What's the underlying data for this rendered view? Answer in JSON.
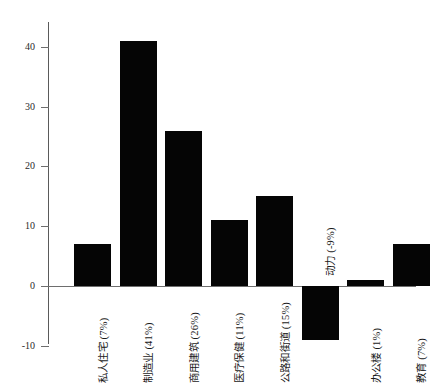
{
  "chart_data": {
    "type": "bar",
    "title": "",
    "subtitle": "",
    "xlabel": "",
    "ylabel": "",
    "ylim": [
      -10,
      45
    ],
    "grid": false,
    "legend": "none",
    "orientation": "vertical",
    "bar_color": "#050505",
    "axis_color": "#6e6e6e",
    "yticks": [
      40,
      30,
      20,
      10,
      0,
      -10
    ],
    "ytick_labels": [
      "40",
      "30",
      "20",
      "10",
      "0",
      "-10"
    ],
    "categories": [
      "私人住宅 (7%)",
      "制造业 (41%)",
      "商用建筑 (26%)",
      "医疗保健 (11%)",
      "公路和街道 (15%)",
      "动力 (-9%)",
      "办公楼 (1%)",
      "教育 (7%)"
    ],
    "values": [
      7,
      41,
      26,
      11,
      15,
      -9,
      1,
      7
    ]
  }
}
